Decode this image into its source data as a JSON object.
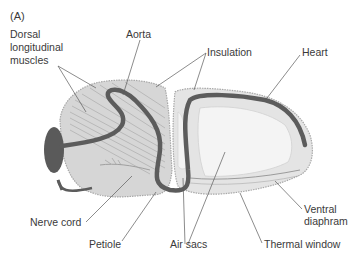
{
  "figure": {
    "panel_label": "(A)"
  },
  "labels": {
    "dorsal_muscles": [
      "Dorsal",
      "longitudinal",
      "muscles"
    ],
    "aorta": "Aorta",
    "insulation": "Insulation",
    "heart": "Heart",
    "nerve_cord": "Nerve cord",
    "petiole": "Petiole",
    "air_sacs": "Air sacs",
    "thermal_window": "Thermal window",
    "ventral_diaphram": [
      "Ventral",
      "diaphram"
    ]
  },
  "colors": {
    "thorax_fill": "#d6d6d6",
    "abdomen_fill": "#e4e4e4",
    "air_sac_fill": "#f4f4f4",
    "vessel": "#5c5c5c",
    "head": "#5a5a5a",
    "text": "#3a3a3a"
  }
}
